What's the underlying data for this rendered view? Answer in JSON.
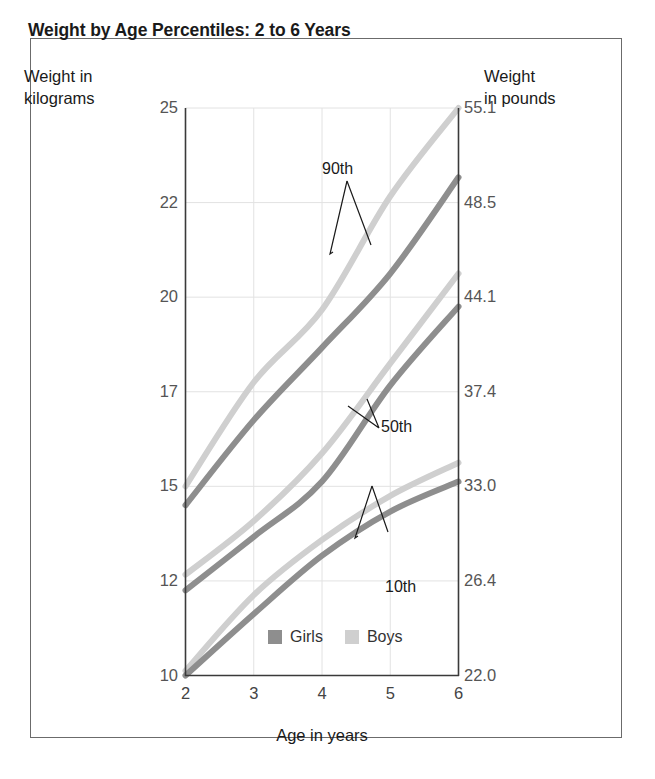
{
  "chart_data": {
    "type": "line",
    "title": "Weight by Age Percentiles: 2 to 6 Years",
    "xlabel": "Age in years",
    "ylabel": "Weight in kilograms",
    "ylabel_right": "Weight in pounds",
    "xlim": [
      2,
      6
    ],
    "ylim": [
      10,
      25
    ],
    "grid": true,
    "legend_position": "bottom-center",
    "x_ticks": [
      "2",
      "3",
      "4",
      "5",
      "6"
    ],
    "y_ticks_left": [
      "25",
      "22",
      "20",
      "17",
      "15",
      "12",
      "10"
    ],
    "y_ticks_right": [
      "55.1",
      "48.5",
      "44.1",
      "37.4",
      "33.0",
      "26.4",
      "22.0"
    ],
    "x": [
      2,
      3,
      4,
      5,
      6
    ],
    "annotations": [
      {
        "label": "90th"
      },
      {
        "label": "50th"
      },
      {
        "label": "10th"
      }
    ],
    "series": [
      {
        "name": "Girls 90th",
        "group": "Girls",
        "percentile": "90th",
        "color": "#8e8e8e",
        "values": [
          14.4,
          16.4,
          18.4,
          20.5,
          22.8
        ]
      },
      {
        "name": "Boys 90th",
        "group": "Boys",
        "percentile": "90th",
        "color": "#cfcfcf",
        "values": [
          15.0,
          17.3,
          19.6,
          22.2,
          25.0
        ]
      },
      {
        "name": "Girls 50th",
        "group": "Girls",
        "percentile": "50th",
        "color": "#8e8e8e",
        "values": [
          11.8,
          13.4,
          15.1,
          17.2,
          19.7
        ]
      },
      {
        "name": "Boys 50th",
        "group": "Boys",
        "percentile": "50th",
        "color": "#cfcfcf",
        "values": [
          12.2,
          13.9,
          15.7,
          17.9,
          20.5
        ]
      },
      {
        "name": "Girls 10th",
        "group": "Girls",
        "percentile": "10th",
        "color": "#8e8e8e",
        "values": [
          10.0,
          11.3,
          12.8,
          14.2,
          15.1
        ]
      },
      {
        "name": "Boys 10th",
        "group": "Boys",
        "percentile": "10th",
        "color": "#cfcfcf",
        "values": [
          10.1,
          11.7,
          13.3,
          14.7,
          15.5
        ]
      }
    ]
  },
  "header": {
    "title": "Weight by Age Percentiles: 2 to 6 Years"
  },
  "axes": {
    "left_caption_line1": "Weight in",
    "left_caption_line2": "kilograms",
    "right_caption_line1": "Weight",
    "right_caption_line2": "in pounds",
    "x_title": "Age in years"
  },
  "legend": {
    "items": [
      {
        "label": "Girls",
        "color": "#8e8e8e"
      },
      {
        "label": "Boys",
        "color": "#cfcfcf"
      }
    ]
  },
  "colors": {
    "girls": "#8e8e8e",
    "boys": "#cfcfcf",
    "grid": "#e2e2e2",
    "axis": "#3a3a3a",
    "frame": "#6b6b6b"
  }
}
